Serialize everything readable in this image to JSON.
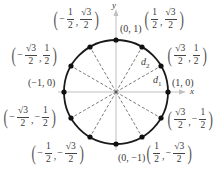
{
  "diagram": {
    "type": "unit-circle",
    "center_px": [
      116,
      92
    ],
    "radius_px": 52,
    "axes": {
      "x_label": "x",
      "y_label": "y"
    },
    "distance_labels": [
      {
        "id": "d2",
        "base": "d",
        "sub": "2"
      },
      {
        "id": "d1",
        "base": "d",
        "sub": "1"
      }
    ],
    "points": [
      {
        "angle_deg": 0,
        "label": "(1, 0)"
      },
      {
        "angle_deg": 30,
        "label": "(√3/2, 1/2)",
        "x": {
          "sign": "",
          "num": "√3",
          "den": "2"
        },
        "y": {
          "sign": "",
          "num": "1",
          "den": "2"
        }
      },
      {
        "angle_deg": 60,
        "label": "(1/2, √3/2)",
        "x": {
          "sign": "",
          "num": "1",
          "den": "2"
        },
        "y": {
          "sign": "",
          "num": "√3",
          "den": "2"
        }
      },
      {
        "angle_deg": 90,
        "label": "(0, 1)"
      },
      {
        "angle_deg": 120,
        "label": "(−1/2, √3/2)",
        "x": {
          "sign": "−",
          "num": "1",
          "den": "2"
        },
        "y": {
          "sign": "",
          "num": "√3",
          "den": "2"
        }
      },
      {
        "angle_deg": 150,
        "label": "(−√3/2, 1/2)",
        "x": {
          "sign": "−",
          "num": "√3",
          "den": "2"
        },
        "y": {
          "sign": "",
          "num": "1",
          "den": "2"
        }
      },
      {
        "angle_deg": 180,
        "label": "(−1, 0)"
      },
      {
        "angle_deg": 210,
        "label": "(−√3/2, −1/2)",
        "x": {
          "sign": "−",
          "num": "√3",
          "den": "2"
        },
        "y": {
          "sign": "−",
          "num": "1",
          "den": "2"
        }
      },
      {
        "angle_deg": 240,
        "label": "(−1/2, −√3/2)",
        "x": {
          "sign": "−",
          "num": "1",
          "den": "2"
        },
        "y": {
          "sign": "−",
          "num": "√3",
          "den": "2"
        }
      },
      {
        "angle_deg": 270,
        "label": "(0, −1)"
      },
      {
        "angle_deg": 300,
        "label": "(1/2, −√3/2)",
        "x": {
          "sign": "",
          "num": "1",
          "den": "2"
        },
        "y": {
          "sign": "−",
          "num": "√3",
          "den": "2"
        }
      },
      {
        "angle_deg": 330,
        "label": "(√3/2, −1/2)",
        "x": {
          "sign": "",
          "num": "√3",
          "den": "2"
        },
        "y": {
          "sign": "−",
          "num": "1",
          "den": "2"
        }
      }
    ],
    "simple_labels": {
      "p0": "(1, 0)",
      "p90": "(0, 1)",
      "p180": "(−1, 0)",
      "p270": "(0, −1)"
    },
    "colors": {
      "circle": "#1a1a1a",
      "axis": "#b0b0b0",
      "dashed": "#444444",
      "point": "#111111",
      "text": "#3a3a3a"
    }
  }
}
